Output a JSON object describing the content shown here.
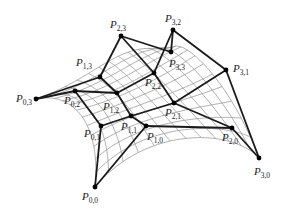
{
  "diagram": {
    "type": "bicubic-bezier-surface",
    "colors": {
      "control_net": "#1a1a1a",
      "surface_grid": "#9a9a9a",
      "points": "#000000",
      "background": "#ffffff"
    },
    "points": [
      {
        "id": "P00",
        "label": "P",
        "sub": "0,0",
        "x": 95,
        "y": 187,
        "lx": 82,
        "ly": 200
      },
      {
        "id": "P01",
        "label": "P",
        "sub": "0,1",
        "x": 101,
        "y": 126,
        "lx": 84,
        "ly": 137
      },
      {
        "id": "P02",
        "label": "P",
        "sub": "0,2",
        "x": 75,
        "y": 91,
        "lx": 64,
        "ly": 104
      },
      {
        "id": "P03",
        "label": "P",
        "sub": "0,3",
        "x": 36,
        "y": 99,
        "lx": 16,
        "ly": 102
      },
      {
        "id": "P10",
        "label": "P",
        "sub": "1,0",
        "x": 146,
        "y": 126,
        "lx": 147,
        "ly": 140
      },
      {
        "id": "P11",
        "label": "P",
        "sub": "1,1",
        "x": 131,
        "y": 116,
        "lx": 121,
        "ly": 130
      },
      {
        "id": "P12",
        "label": "P",
        "sub": "1,2",
        "x": 117,
        "y": 93,
        "lx": 103,
        "ly": 110
      },
      {
        "id": "P13",
        "label": "P",
        "sub": "1,3",
        "x": 100,
        "y": 77,
        "lx": 76,
        "ly": 66
      },
      {
        "id": "P20",
        "label": "P",
        "sub": "2,0",
        "x": 232,
        "y": 128,
        "lx": 222,
        "ly": 141
      },
      {
        "id": "P21",
        "label": "P",
        "sub": "2,1",
        "x": 174,
        "y": 103,
        "lx": 165,
        "ly": 116
      },
      {
        "id": "P22",
        "label": "P",
        "sub": "2,2",
        "x": 154,
        "y": 73,
        "lx": 145,
        "ly": 86
      },
      {
        "id": "P23",
        "label": "P",
        "sub": "2,3",
        "x": 121,
        "y": 36,
        "lx": 110,
        "ly": 28
      },
      {
        "id": "P30",
        "label": "P",
        "sub": "3,0",
        "x": 259,
        "y": 158,
        "lx": 254,
        "ly": 175
      },
      {
        "id": "P31",
        "label": "P",
        "sub": "3,1",
        "x": 226,
        "y": 70,
        "lx": 233,
        "ly": 72
      },
      {
        "id": "P32",
        "label": "P",
        "sub": "3,2",
        "x": 173,
        "y": 30,
        "lx": 165,
        "ly": 22
      },
      {
        "id": "P33",
        "label": "P",
        "sub": "3,3",
        "x": 171,
        "y": 52,
        "lx": 169,
        "ly": 67
      }
    ]
  }
}
